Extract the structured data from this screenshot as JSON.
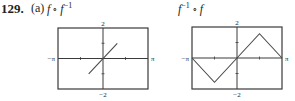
{
  "problem": {
    "number": "129.",
    "part": "(a)"
  },
  "chart_data": [
    {
      "type": "line",
      "title": "f ∘ f⁻¹",
      "title_base": "f",
      "title_op": "∘",
      "title_func": "f",
      "title_sup": "−1",
      "xlabel": "",
      "ylabel": "",
      "xlim": [
        -3.14159,
        3.14159
      ],
      "ylim": [
        -2,
        2
      ],
      "x_tick_labels": {
        "left": "−π",
        "right": "π"
      },
      "y_tick_labels": {
        "top": "2",
        "bottom": "−2"
      },
      "x_ticks": [
        -1.5708,
        1.5708
      ],
      "y_ticks": [
        -1,
        1
      ],
      "grid": false,
      "series": [
        {
          "name": "f(f^-1(x)) = x",
          "x": [
            -1,
            1
          ],
          "y": [
            -1,
            1
          ]
        }
      ]
    },
    {
      "type": "line",
      "title": "f⁻¹ ∘ f",
      "title_base": "f",
      "title_sup": "−1",
      "title_op": "∘",
      "title_func": "f",
      "xlabel": "",
      "ylabel": "",
      "xlim": [
        -3.14159,
        3.14159
      ],
      "ylim": [
        -2,
        2
      ],
      "x_tick_labels": {
        "left": "−π",
        "right": "π"
      },
      "y_tick_labels": {
        "top": "2",
        "bottom": "−2"
      },
      "x_ticks": [
        -1.5708,
        1.5708
      ],
      "y_ticks": [
        -1,
        1
      ],
      "grid": false,
      "series": [
        {
          "name": "f^-1(f(x))",
          "x": [
            -3.14159,
            -1.5708,
            0,
            1.5708,
            3.14159
          ],
          "y": [
            0,
            -1.5708,
            0,
            1.5708,
            0
          ]
        }
      ]
    }
  ],
  "colors": {
    "ink": "#231f20",
    "frame": "#3a3a3a",
    "curve": "#4a4a4a"
  }
}
